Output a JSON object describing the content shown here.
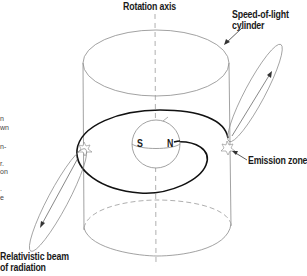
{
  "diagram": {
    "labels": {
      "rotation_axis": "Rotation axis",
      "speed_of_light_1": "Speed-of-light",
      "speed_of_light_2": "cylinder",
      "emission_zone": "Emission zone",
      "beam_1": "Relativistic beam",
      "beam_2": "of radiation",
      "pole_s": "S",
      "pole_n": "N"
    },
    "margin_fragments": [
      "n",
      "wn",
      "n-",
      "r.",
      "on",
      ".",
      "e"
    ],
    "colors": {
      "line": "#8a8a8a",
      "field_line": "#111111",
      "text": "#1a1a1a"
    }
  }
}
